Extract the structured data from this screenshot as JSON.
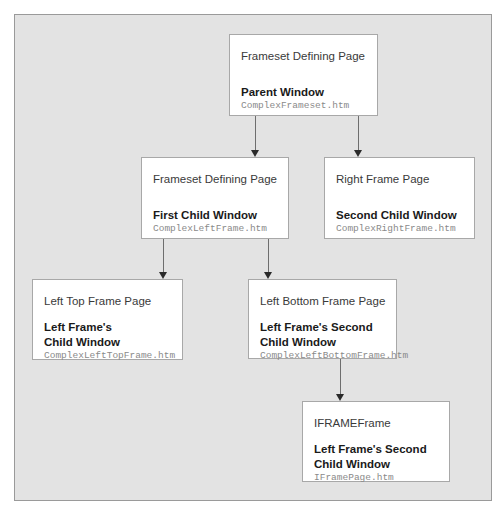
{
  "diagram": {
    "colors": {
      "background": "#ffffff",
      "panel": "#e3e3e3",
      "box": "#ffffff",
      "connector": "#6e6e6e"
    },
    "nodes": [
      {
        "id": "parent",
        "page_label": "Frameset Defining Page",
        "window_name": "Parent Window",
        "file_name": "ComplexFrameset.htm"
      },
      {
        "id": "first-child",
        "page_label": "Frameset Defining Page",
        "window_name": "First Child Window",
        "file_name": "ComplexLeftFrame.htm"
      },
      {
        "id": "right-frame",
        "page_label": "Right Frame Page",
        "window_name": "Second Child Window",
        "file_name": "ComplexRightFrame.htm"
      },
      {
        "id": "left-top",
        "page_label": "Left Top Frame Page",
        "window_name": "Left Frame's\nChild Window",
        "file_name": "ComplexLeftTopFrame.htm"
      },
      {
        "id": "left-bottom",
        "page_label": "Left Bottom Frame Page",
        "window_name": "Left Frame's Second\nChild Window",
        "file_name": "ComplexLeftBottomFrame.htm"
      },
      {
        "id": "iframe",
        "page_label": "IFRAMEFrame",
        "window_name": "Left Frame's Second\nChild Window",
        "file_name": "IFramePage.htm"
      }
    ],
    "edges": [
      {
        "from": "parent",
        "to": "first-child"
      },
      {
        "from": "parent",
        "to": "right-frame"
      },
      {
        "from": "first-child",
        "to": "left-top"
      },
      {
        "from": "first-child",
        "to": "left-bottom"
      },
      {
        "from": "left-bottom",
        "to": "iframe"
      }
    ]
  }
}
